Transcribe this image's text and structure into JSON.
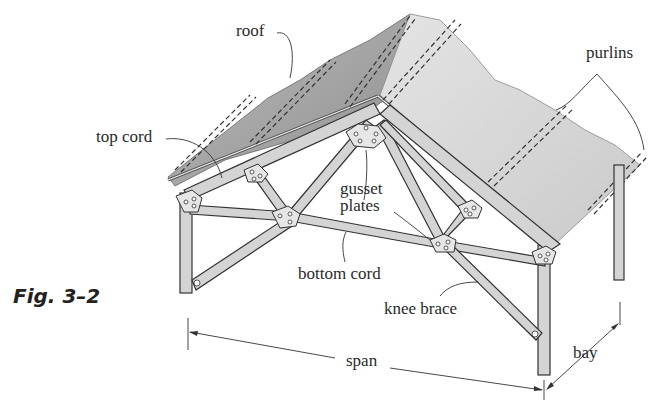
{
  "figure": {
    "caption": "Fig. 3–2",
    "type": "truss roof structure illustration"
  },
  "labels": {
    "roof": "roof",
    "purlins": "purlins",
    "top_cord": "top cord",
    "gusset_line1": "gusset",
    "gusset_line2": "plates",
    "bottom_cord": "bottom cord",
    "knee_brace": "knee brace",
    "span": "span",
    "bay": "bay"
  },
  "colors": {
    "roof_dark": "#9a9a9a",
    "roof_light": "#d6d6d6",
    "member": "#cfcfcf",
    "outline": "#333333",
    "text": "#2a2a2a"
  }
}
